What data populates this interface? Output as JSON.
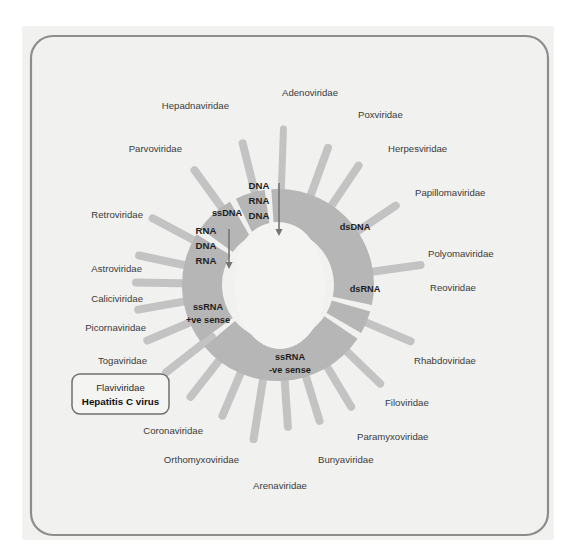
{
  "figure": {
    "background_color": "#f1f1f0",
    "frame_color": "#8d8d8d",
    "ring_color": "#b6b6b6",
    "spoke_color": "#c3c3c3",
    "hole_color": "#f4f4f3",
    "label_color": "#3b3b3b"
  },
  "chart_data": {
    "type": "pie",
    "legend_position": "none",
    "grid": false,
    "center": {
      "cx": 278,
      "cy": 285
    },
    "inner_radius": 56,
    "outer_radius": 96,
    "segments": [
      {
        "label": "dsDNA",
        "start_deg": -90,
        "end_deg": 12,
        "families": [
          "Adenoviridae",
          "Poxviridae",
          "Herpesviridae",
          "Papillomaviridae",
          "Polyomaviridae"
        ]
      },
      {
        "label": "dsRNA",
        "start_deg": 16,
        "end_deg": 30,
        "families": [
          "Reoviridae"
        ]
      },
      {
        "label": "ssRNA\n-ve sense",
        "start_deg": 34,
        "end_deg": 140,
        "families": [
          "Rhabdoviridae",
          "Filoviridae",
          "Paramyxoviridae",
          "Bunyaviridae",
          "Arenaviridae",
          "Orthomyxoviridae"
        ]
      },
      {
        "label": "ssRNA\n+ve sense",
        "start_deg": 144,
        "end_deg": 212,
        "families": [
          "Coronaviridae",
          "Flaviviridae",
          "Togaviridae",
          "Picornaviridae",
          "Caliciviridae",
          "Astroviridae"
        ]
      },
      {
        "label": "RNA DNA RNA",
        "start_deg": 216,
        "end_deg": 240,
        "families": [
          "Retroviridae"
        ]
      },
      {
        "label": "ssDNA",
        "start_deg": 244,
        "end_deg": 262,
        "families": [
          "Parvoviridae"
        ]
      },
      {
        "label": "DNA RNA DNA",
        "start_deg": 266,
        "end_deg": 270,
        "families": [
          "Hepadnaviridae"
        ]
      }
    ]
  },
  "segment_labels": [
    {
      "id": "dsdna",
      "text": "dsDNA",
      "x": 355,
      "y": 230
    },
    {
      "id": "dsrna",
      "text": "dsRNA",
      "x": 365,
      "y": 292
    },
    {
      "id": "ssrnaneg_1",
      "text": "ssRNA",
      "x": 290,
      "y": 360
    },
    {
      "id": "ssrnaneg_2",
      "text": "-ve sense",
      "x": 290,
      "y": 373
    },
    {
      "id": "ssrnapos_1",
      "text": "ssRNA",
      "x": 208,
      "y": 310
    },
    {
      "id": "ssrnapos_2",
      "text": "+ve sense",
      "x": 208,
      "y": 323
    },
    {
      "id": "ssdna",
      "text": "ssDNA",
      "x": 227,
      "y": 216
    }
  ],
  "flow_annotations": [
    {
      "id": "hepadna-flow",
      "lines": [
        "DNA",
        "RNA",
        "DNA"
      ],
      "x": 259,
      "y": 189,
      "arrow": {
        "x": 279,
        "y": 183,
        "len": 53
      }
    },
    {
      "id": "retro-flow",
      "lines": [
        "RNA",
        "DNA",
        "RNA"
      ],
      "x": 206,
      "y": 234,
      "arrow": {
        "x": 229,
        "y": 229,
        "len": 40
      }
    }
  ],
  "families": [
    {
      "name": "Adenoviridae",
      "label_x": 310,
      "label_y": 96,
      "anchor": "middle",
      "spoke_deg": -88,
      "spoke_len": 72,
      "spoke_w": 7
    },
    {
      "name": "Poxviridae",
      "label_x": 358,
      "label_y": 118,
      "anchor": "start",
      "spoke_deg": -70,
      "spoke_len": 62,
      "spoke_w": 8
    },
    {
      "name": "Herpesviridae",
      "label_x": 388,
      "label_y": 152,
      "anchor": "start",
      "spoke_deg": -56,
      "spoke_len": 60,
      "spoke_w": 8
    },
    {
      "name": "Papillomaviridae",
      "label_x": 415,
      "label_y": 196,
      "anchor": "start",
      "spoke_deg": -34,
      "spoke_len": 58,
      "spoke_w": 8
    },
    {
      "name": "Polyomaviridae",
      "label_x": 428,
      "label_y": 257,
      "anchor": "start",
      "spoke_deg": -8,
      "spoke_len": 60,
      "spoke_w": 8
    },
    {
      "name": "Reoviridae",
      "label_x": 430,
      "label_y": 291,
      "anchor": "start",
      "spoke_deg": 23,
      "spoke_len": 60,
      "spoke_w": 8
    },
    {
      "name": "Rhabdoviridae",
      "label_x": 414,
      "label_y": 364,
      "anchor": "start",
      "spoke_deg": 44,
      "spoke_len": 58,
      "spoke_w": 8
    },
    {
      "name": "Filoviridae",
      "label_x": 385,
      "label_y": 406,
      "anchor": "start",
      "spoke_deg": 59,
      "spoke_len": 58,
      "spoke_w": 8
    },
    {
      "name": "Paramyxoviridae",
      "label_x": 357,
      "label_y": 440,
      "anchor": "start",
      "spoke_deg": 73,
      "spoke_len": 58,
      "spoke_w": 8
    },
    {
      "name": "Bunyaviridae",
      "label_x": 318,
      "label_y": 463,
      "anchor": "start",
      "spoke_deg": 86,
      "spoke_len": 58,
      "spoke_w": 8
    },
    {
      "name": "Arenaviridae",
      "label_x": 280,
      "label_y": 489,
      "anchor": "middle",
      "spoke_deg": 99,
      "spoke_len": 72,
      "spoke_w": 8
    },
    {
      "name": "Orthomyxoviridae",
      "label_x": 239,
      "label_y": 463,
      "anchor": "end",
      "spoke_deg": 113,
      "spoke_len": 58,
      "spoke_w": 8
    },
    {
      "name": "Coronaviridae",
      "label_x": 203,
      "label_y": 434,
      "anchor": "end",
      "spoke_deg": 128,
      "spoke_len": 58,
      "spoke_w": 8
    },
    {
      "name": "Togaviridae",
      "label_x": 147,
      "label_y": 364,
      "anchor": "end",
      "spoke_deg": 157,
      "spoke_len": 58,
      "spoke_w": 8
    },
    {
      "name": "Picornaviridae",
      "label_x": 146,
      "label_y": 331,
      "anchor": "end",
      "spoke_deg": 170,
      "spoke_len": 58,
      "spoke_w": 8
    },
    {
      "name": "Caliciviridae",
      "label_x": 143,
      "label_y": 302,
      "anchor": "end",
      "spoke_deg": 181,
      "spoke_len": 58,
      "spoke_w": 8
    },
    {
      "name": "Astroviridae",
      "label_x": 142,
      "label_y": 272,
      "anchor": "end",
      "spoke_deg": 192,
      "spoke_len": 58,
      "spoke_w": 8
    },
    {
      "name": "Retroviridae",
      "label_x": 143,
      "label_y": 218,
      "anchor": "end",
      "spoke_deg": 208,
      "spoke_len": 58,
      "spoke_w": 8
    },
    {
      "name": "Parvoviridae",
      "label_x": 182,
      "label_y": 152,
      "anchor": "end",
      "spoke_deg": 234,
      "spoke_len": 58,
      "spoke_w": 8
    },
    {
      "name": "Hepadnaviridae",
      "label_x": 229,
      "label_y": 109,
      "anchor": "end",
      "spoke_deg": 256,
      "spoke_len": 62,
      "spoke_w": 8
    }
  ],
  "highlight_box": {
    "line1": "Flaviviridae",
    "line2": "Hepatitis C virus",
    "x": 72,
    "y": 374,
    "w": 97,
    "h": 40,
    "border_color": "#6f6f6f",
    "fill_color": "#f4f4f3",
    "spoke_deg": 142,
    "spoke_len": 58
  }
}
